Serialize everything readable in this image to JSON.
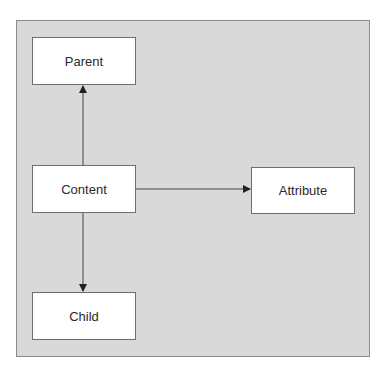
{
  "diagram": {
    "nodes": [
      {
        "id": "parent",
        "label": "Parent"
      },
      {
        "id": "content",
        "label": "Content"
      },
      {
        "id": "attribute",
        "label": "Attribute"
      },
      {
        "id": "child",
        "label": "Child"
      }
    ],
    "edges": [
      {
        "from": "content",
        "to": "parent"
      },
      {
        "from": "content",
        "to": "attribute"
      },
      {
        "from": "content",
        "to": "child"
      }
    ],
    "colors": {
      "panel": "#d9d9d9",
      "node_fill": "#ffffff",
      "line": "#333333"
    }
  }
}
